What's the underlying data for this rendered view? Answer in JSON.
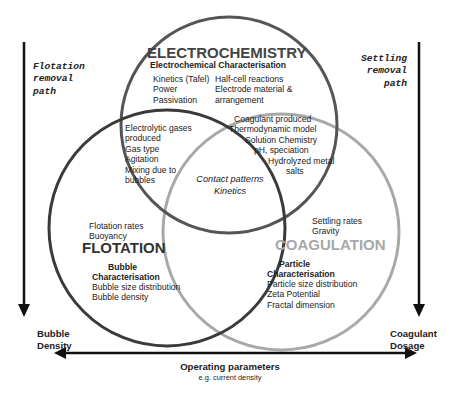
{
  "side_labels": {
    "left_path": [
      "Flotation",
      "removal",
      "path"
    ],
    "right_path": [
      "Settling",
      "removal",
      "path"
    ],
    "left_axis": [
      "Bubble",
      "Density"
    ],
    "right_axis": [
      "Coagulant",
      "Dosage"
    ],
    "bottom_axis_title": "Operating parameters",
    "bottom_axis_subtitle": "e.g. current density"
  },
  "circles": {
    "electrochemistry": {
      "title": "ELECTROCHEMISTRY",
      "subtitle": "Electrochemical Characterisation",
      "col_left": [
        "Kinetics (Tafel)",
        "Power",
        "Passivation"
      ],
      "col_right": [
        "Half-cell reactions",
        "Electrode material &",
        "arrangement"
      ],
      "color": "#555555"
    },
    "flotation": {
      "title": "FLOTATION",
      "top_items": [
        "Flotation rates",
        "Buoyancy"
      ],
      "char_title": [
        "Bubble",
        "Characterisation"
      ],
      "char_items": [
        "Bubble size distribution",
        "Bubble density"
      ],
      "color": "#3a3a3a"
    },
    "coagulation": {
      "title": "COAGULATION",
      "top_items": [
        "Settling rates",
        "Gravity"
      ],
      "char_title": [
        "Particle",
        "Characterisation"
      ],
      "char_items": [
        "Particle size distribution",
        "Zeta Potential",
        "Fractal dimension"
      ],
      "color": "#a8a8a8"
    }
  },
  "overlaps": {
    "electro_flotation": [
      "Electrolytic gases",
      "produced",
      "Gas type",
      "Agitation",
      "Mixing due to",
      "bubbles"
    ],
    "electro_coagulation": [
      "Coagulant produced",
      "Thermodynamic model",
      "Solution Chemistry",
      "pH, speciation",
      "Hydrolyzed metal",
      "salts"
    ],
    "center": [
      "Contact patterns",
      "Kinetics"
    ]
  }
}
